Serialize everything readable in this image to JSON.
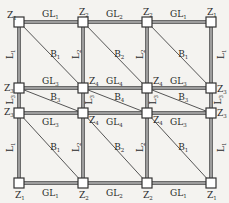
{
  "diagram": {
    "columns_x": [
      19,
      83,
      147,
      211
    ],
    "rows_y": [
      22,
      88,
      113,
      183
    ],
    "colors": {
      "background": "#f4f3f0",
      "beam": "#6a6a6a",
      "brace": "#555555",
      "node_fill": "#ffffff",
      "node_stroke": "#333333",
      "text": "#2a2a2a"
    },
    "nodes": [
      {
        "id": "n00",
        "label": "Z",
        "sub": "1",
        "r": 0,
        "c": 0,
        "lx": -12,
        "ly": -4
      },
      {
        "id": "n01",
        "label": "Z",
        "sub": "2",
        "r": 0,
        "c": 1,
        "lx": -4,
        "ly": -7
      },
      {
        "id": "n02",
        "label": "Z",
        "sub": "2",
        "r": 0,
        "c": 2,
        "lx": -4,
        "ly": -7
      },
      {
        "id": "n03",
        "label": "Z",
        "sub": "1",
        "r": 0,
        "c": 3,
        "lx": -4,
        "ly": -7
      },
      {
        "id": "n10",
        "label": "Z",
        "sub": "3",
        "r": 1,
        "c": 0,
        "lx": -15,
        "ly": 3
      },
      {
        "id": "n11",
        "label": "Z",
        "sub": "4",
        "r": 1,
        "c": 1,
        "lx": 6,
        "ly": -4
      },
      {
        "id": "n12",
        "label": "Z",
        "sub": "4",
        "r": 1,
        "c": 2,
        "lx": 6,
        "ly": -4
      },
      {
        "id": "n13",
        "label": "Z",
        "sub": "3",
        "r": 1,
        "c": 3,
        "lx": 6,
        "ly": 4
      },
      {
        "id": "n20",
        "label": "Z",
        "sub": "3",
        "r": 2,
        "c": 0,
        "lx": -15,
        "ly": 2
      },
      {
        "id": "n21",
        "label": "Z",
        "sub": "4",
        "r": 2,
        "c": 1,
        "lx": 6,
        "ly": 10
      },
      {
        "id": "n22",
        "label": "Z",
        "sub": "4",
        "r": 2,
        "c": 2,
        "lx": 6,
        "ly": 10
      },
      {
        "id": "n23",
        "label": "Z",
        "sub": "3",
        "r": 2,
        "c": 3,
        "lx": 6,
        "ly": 3
      },
      {
        "id": "n30",
        "label": "Z",
        "sub": "1",
        "r": 3,
        "c": 0,
        "lx": -4,
        "ly": 15
      },
      {
        "id": "n31",
        "label": "Z",
        "sub": "2",
        "r": 3,
        "c": 1,
        "lx": -4,
        "ly": 15
      },
      {
        "id": "n32",
        "label": "Z",
        "sub": "2",
        "r": 3,
        "c": 2,
        "lx": -4,
        "ly": 15
      },
      {
        "id": "n33",
        "label": "Z",
        "sub": "1",
        "r": 3,
        "c": 3,
        "lx": -4,
        "ly": 15
      }
    ],
    "horizontal_beams": [
      {
        "r": 0,
        "labels": [
          {
            "t": "GL",
            "s": "1"
          },
          {
            "t": "GL",
            "s": "2"
          },
          {
            "t": "GL",
            "s": "1"
          }
        ],
        "dy": -5
      },
      {
        "r": 1,
        "labels": [
          {
            "t": "GL",
            "s": "3"
          },
          {
            "t": "GL",
            "s": "4"
          },
          {
            "t": "GL",
            "s": "3"
          }
        ],
        "dy": -4
      },
      {
        "r": 2,
        "labels": [
          {
            "t": "GL",
            "s": "3"
          },
          {
            "t": "GL",
            "s": "4"
          },
          {
            "t": "GL",
            "s": "3"
          }
        ],
        "dy": 12
      },
      {
        "r": 3,
        "labels": [
          {
            "t": "GL",
            "s": "1"
          },
          {
            "t": "GL",
            "s": "2"
          },
          {
            "t": "GL",
            "s": "1"
          }
        ],
        "dy": 13
      }
    ],
    "vertical_labels": [
      {
        "r": 0,
        "c": 0,
        "t": "L",
        "s": "1",
        "dx": -12
      },
      {
        "r": 0,
        "c": 1,
        "t": "L",
        "s": "2",
        "dx": -10
      },
      {
        "r": 0,
        "c": 2,
        "t": "L",
        "s": "2",
        "dx": -10
      },
      {
        "r": 0,
        "c": 3,
        "t": "L",
        "s": "1",
        "dx": 7
      },
      {
        "r": 1,
        "c": 0,
        "t": "L",
        "s": "3",
        "dx": -12
      },
      {
        "r": 1,
        "c": 1,
        "t": "L",
        "s": "3",
        "dx": 3
      },
      {
        "r": 1,
        "c": 2,
        "t": "L",
        "s": "3",
        "dx": 3
      },
      {
        "r": 1,
        "c": 3,
        "t": "L",
        "s": "3",
        "dx": 4
      },
      {
        "r": 2,
        "c": 0,
        "t": "L",
        "s": "1",
        "dx": -12
      },
      {
        "r": 2,
        "c": 1,
        "t": "L",
        "s": "2",
        "dx": -10
      },
      {
        "r": 2,
        "c": 2,
        "t": "L",
        "s": "2",
        "dx": -10
      },
      {
        "r": 2,
        "c": 3,
        "t": "L",
        "s": "1",
        "dx": 7
      }
    ],
    "braces": [
      {
        "r": 0,
        "c": 0,
        "t": "B",
        "s": "1",
        "lx": 0.55,
        "ly": 0.48
      },
      {
        "r": 0,
        "c": 1,
        "t": "B",
        "s": "2",
        "lx": 0.55,
        "ly": 0.48
      },
      {
        "r": 0,
        "c": 2,
        "t": "B",
        "s": "1",
        "lx": 0.55,
        "ly": 0.48
      },
      {
        "r": 1,
        "c": 0,
        "t": "B",
        "s": "3",
        "lx": 0.55,
        "ly": 0.35
      },
      {
        "r": 1,
        "c": 1,
        "t": "B",
        "s": "4",
        "lx": 0.55,
        "ly": 0.35
      },
      {
        "r": 1,
        "c": 2,
        "t": "B",
        "s": "3",
        "lx": 0.55,
        "ly": 0.35
      },
      {
        "r": 2,
        "c": 0,
        "t": "B",
        "s": "1",
        "lx": 0.55,
        "ly": 0.48
      },
      {
        "r": 2,
        "c": 1,
        "t": "B",
        "s": "2",
        "lx": 0.55,
        "ly": 0.48
      },
      {
        "r": 2,
        "c": 2,
        "t": "B",
        "s": "1",
        "lx": 0.55,
        "ly": 0.48
      }
    ]
  }
}
